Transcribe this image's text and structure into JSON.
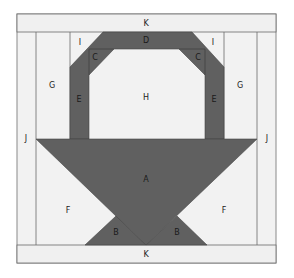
{
  "diagram": {
    "colors": {
      "background": "#f2f2f2",
      "dark_fabric": "#606060",
      "line": "#6a6a6a",
      "outer_border": "#8a8a8a"
    },
    "labels": {
      "top_band": "K",
      "bottom_band": "K",
      "left_corner_top": "I",
      "right_corner_top": "I",
      "top_arch": "D",
      "left_inner_corner": "C",
      "right_inner_corner": "C",
      "left_side": "G",
      "right_side": "G",
      "left_handle": "E",
      "right_handle": "E",
      "center": "H",
      "left_strip": "J",
      "right_strip": "J",
      "basket": "A",
      "left_bottom": "F",
      "right_bottom": "F",
      "left_base_triangle": "B",
      "right_base_triangle": "B"
    }
  }
}
